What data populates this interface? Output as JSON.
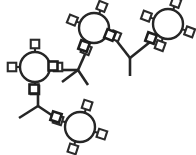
{
  "image": {
    "title": "Molecular structure diagram",
    "width": 196,
    "height": 155,
    "background_color": "#ffffff",
    "line_color": "#262626",
    "node_fill_color": "#ffffff",
    "node_stroke_color": "#2b2b2b"
  },
  "chart_data": {
    "type": "diagram",
    "subtype": "chemical-structure",
    "title": "",
    "xlabel": "",
    "ylabel": "",
    "xlim": [
      0,
      196
    ],
    "ylim": [
      0,
      155
    ],
    "grid": false,
    "legend": false,
    "rings": [
      {
        "id": "ring-left",
        "label": "aromatic-ring-left",
        "cx": 35,
        "cy": 67,
        "r": 15,
        "stroke_width": 2.4,
        "rotation_deg": 0,
        "substituent_count": 4,
        "substituents": [
          {
            "angle_deg": 270,
            "label": "node-n"
          },
          {
            "angle_deg": 0,
            "label": "node-e"
          },
          {
            "angle_deg": 90,
            "label": "node-s"
          },
          {
            "angle_deg": 180,
            "label": "node-w"
          }
        ]
      },
      {
        "id": "ring-top-center",
        "label": "aromatic-ring-top-center",
        "cx": 94,
        "cy": 28,
        "r": 15,
        "stroke_width": 2.4,
        "rotation_deg": 22,
        "substituent_count": 4,
        "substituents": [
          {
            "angle_deg": 268,
            "label": "node-n"
          },
          {
            "angle_deg": 358,
            "label": "node-e"
          },
          {
            "angle_deg": 88,
            "label": "node-s"
          },
          {
            "angle_deg": 178,
            "label": "node-w"
          }
        ]
      },
      {
        "id": "ring-top-right",
        "label": "aromatic-ring-top-right",
        "cx": 168,
        "cy": 24,
        "r": 15,
        "stroke_width": 2.4,
        "rotation_deg": 20,
        "substituent_count": 4,
        "substituents": [
          {
            "angle_deg": 270,
            "label": "node-n"
          },
          {
            "angle_deg": 0,
            "label": "node-e"
          },
          {
            "angle_deg": 90,
            "label": "node-s"
          },
          {
            "angle_deg": 180,
            "label": "node-w"
          }
        ]
      },
      {
        "id": "ring-bottom",
        "label": "aromatic-ring-bottom",
        "cx": 80,
        "cy": 127,
        "r": 15,
        "stroke_width": 2.4,
        "rotation_deg": 18,
        "substituent_count": 4,
        "substituents": [
          {
            "angle_deg": 270,
            "label": "node-n"
          },
          {
            "angle_deg": 0,
            "label": "node-e"
          },
          {
            "angle_deg": 90,
            "label": "node-s"
          },
          {
            "angle_deg": 180,
            "label": "node-w"
          }
        ]
      }
    ],
    "link_squares": [
      {
        "id": "link-left-e",
        "x": 53,
        "y": 66,
        "size": 9,
        "rotation_deg": 0,
        "stroke_width": 2.6
      },
      {
        "id": "link-left-s",
        "x": 34,
        "y": 89,
        "size": 9,
        "rotation_deg": 0,
        "stroke_width": 2.6
      },
      {
        "id": "link-center-sw",
        "x": 84,
        "y": 46,
        "size": 9,
        "rotation_deg": 20,
        "stroke_width": 2.6
      },
      {
        "id": "link-center-se",
        "x": 110,
        "y": 35,
        "size": 9,
        "rotation_deg": 22,
        "stroke_width": 2.6
      },
      {
        "id": "link-right-w",
        "x": 151,
        "y": 38,
        "size": 9,
        "rotation_deg": 20,
        "stroke_width": 2.6
      },
      {
        "id": "link-bottom-w",
        "x": 56,
        "y": 117,
        "size": 9,
        "rotation_deg": 18,
        "stroke_width": 2.6
      }
    ],
    "bonds": [
      {
        "id": "bond-left-e-to-chain",
        "x1": 58,
        "y1": 70,
        "x2": 78,
        "y2": 70,
        "stroke_width": 2.6
      },
      {
        "id": "bond-chain-a-up",
        "x1": 78,
        "y1": 70,
        "x2": 86,
        "y2": 52,
        "stroke_width": 2.6
      },
      {
        "id": "bond-chain-a-down",
        "x1": 78,
        "y1": 70,
        "x2": 88,
        "y2": 85,
        "stroke_width": 2.6
      },
      {
        "id": "bond-chain-a-methyl",
        "x1": 78,
        "y1": 70,
        "x2": 62,
        "y2": 82,
        "stroke_width": 2.6
      },
      {
        "id": "bond-center-se-to-chain",
        "x1": 116,
        "y1": 40,
        "x2": 130,
        "y2": 58,
        "stroke_width": 2.6
      },
      {
        "id": "bond-chain-b-methyl",
        "x1": 130,
        "y1": 58,
        "x2": 130,
        "y2": 76,
        "stroke_width": 2.6
      },
      {
        "id": "bond-chain-b-up",
        "x1": 130,
        "y1": 58,
        "x2": 150,
        "y2": 42,
        "stroke_width": 2.6
      },
      {
        "id": "bond-left-s-to-chain",
        "x1": 38,
        "y1": 94,
        "x2": 38,
        "y2": 106,
        "stroke_width": 2.6
      },
      {
        "id": "bond-chain-c-methyl",
        "x1": 38,
        "y1": 106,
        "x2": 19,
        "y2": 118,
        "stroke_width": 2.6
      },
      {
        "id": "bond-chain-c-down",
        "x1": 38,
        "y1": 106,
        "x2": 56,
        "y2": 118,
        "stroke_width": 2.6
      }
    ]
  }
}
